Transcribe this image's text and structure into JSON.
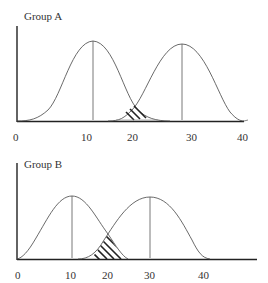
{
  "panels": [
    {
      "title": "Group A",
      "x_ticks": [
        "0",
        "10",
        "20",
        "30",
        "40"
      ],
      "distributions": [
        {
          "mean": 11,
          "label": "left distribution"
        },
        {
          "mean": 28,
          "label": "right distribution"
        }
      ],
      "overlap": "small (around 20)"
    },
    {
      "title": "Group B",
      "x_ticks": [
        "0",
        "10",
        "20",
        "30",
        "40"
      ],
      "distributions": [
        {
          "mean": 10,
          "label": "left distribution"
        },
        {
          "mean": 30,
          "label": "right distribution"
        }
      ],
      "overlap": "large hatched region (around 15-24)"
    }
  ]
}
